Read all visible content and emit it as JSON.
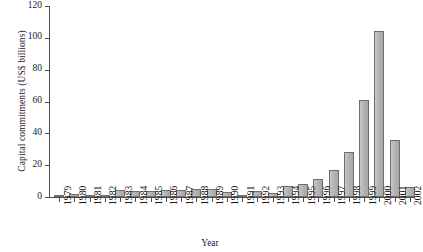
{
  "chart_data": {
    "type": "bar",
    "title": "",
    "xlabel": "Year",
    "ylabel": "Capital commitments (US$ billions)",
    "categories": [
      "1979",
      "1980",
      "1981",
      "1982",
      "1983",
      "1984",
      "1985",
      "1986",
      "1987",
      "1988",
      "1989",
      "1990",
      "1991",
      "1992",
      "1993",
      "1994",
      "1995",
      "1996",
      "1997",
      "1998",
      "1999",
      "2000",
      "2001",
      "2002"
    ],
    "values": [
      0.3,
      2.1,
      1.3,
      1.4,
      4.5,
      3.5,
      4.0,
      4.2,
      4.5,
      4.8,
      5.0,
      3.3,
      1.5,
      4.0,
      2.8,
      7.0,
      8.0,
      11.5,
      17.0,
      28.0,
      61.0,
      104.0,
      36.0,
      6.0
    ],
    "series": [
      {
        "name": "Capital commitments",
        "values": [
          0.3,
          2.1,
          1.3,
          1.4,
          4.5,
          3.5,
          4.0,
          4.2,
          4.5,
          4.8,
          5.0,
          3.3,
          1.5,
          4.0,
          2.8,
          7.0,
          8.0,
          11.5,
          17.0,
          28.0,
          61.0,
          104.0,
          36.0,
          6.0
        ]
      }
    ],
    "ylim": [
      0,
      120
    ],
    "yticks": [
      0,
      20,
      40,
      60,
      80,
      100,
      120
    ],
    "ytick_labels": [
      "0",
      "20",
      "40",
      "60",
      "80",
      "100",
      "120"
    ],
    "grid": false,
    "legend": false,
    "bar_color": "#b3b3b3",
    "bar_edge_color": "#6e6e6e",
    "axis_color": "#4d4d4d"
  }
}
